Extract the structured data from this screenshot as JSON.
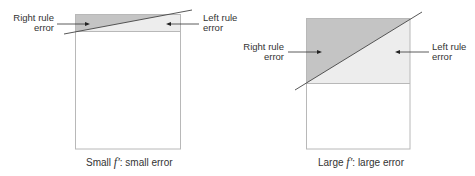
{
  "colors": {
    "dark_region": "#c4c4c4",
    "light_region": "#ededed",
    "frame": "#b8b8b8",
    "line": "#444444",
    "text": "#333333"
  },
  "left_panel": {
    "right_label_line1": "Right rule",
    "right_label_line2": "error",
    "left_label_line1": "Left rule",
    "left_label_line2": "error",
    "caption_prefix": "Small ",
    "caption_symbol": "f′",
    "caption_suffix": ": small error"
  },
  "right_panel": {
    "right_label_line1": "Right rule",
    "right_label_line2": "error",
    "left_label_line1": "Left rule",
    "left_label_line2": "error",
    "caption_prefix": "Large ",
    "caption_symbol": "f′",
    "caption_suffix": ": large error"
  }
}
